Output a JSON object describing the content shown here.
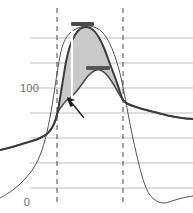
{
  "chart_data": {
    "type": "area",
    "title": "",
    "xlabel": "",
    "ylabel": "",
    "ylim": [
      0,
      200
    ],
    "xlim": [
      0,
      193
    ],
    "grid": true,
    "grid_y_values": [
      0,
      22,
      44,
      66,
      88,
      100,
      122,
      144
    ],
    "axis_ticks": [
      {
        "label": "100",
        "y_value": 100,
        "pixel_y": 88
      },
      {
        "label": "0",
        "y_value": 0,
        "pixel_y": 202
      }
    ],
    "legend": {
      "visible": false,
      "position": "none"
    },
    "colors": {
      "shaded_band": "#c9c9c9",
      "upper_curve": "#3c3c3c",
      "lower_curve": "#4a4a4a",
      "thin_curve": "#555555",
      "gridline": "#b4b4b4",
      "dashed_marker": "#444444",
      "bar_marker_upper": "#4a4a4a",
      "bar_marker_lower": "#555555",
      "cursor_arrow": "#1a1a1a",
      "inner_white_line": "#ffffff",
      "axis_label_text": "#6b6b6b"
    },
    "series": [
      {
        "name": "upper-envelope-curve",
        "style": "solid-dark",
        "points": [
          [
            0,
            150
          ],
          [
            12,
            147
          ],
          [
            22,
            144
          ],
          [
            32,
            141
          ],
          [
            40,
            138
          ],
          [
            48,
            133
          ],
          [
            54,
            124
          ],
          [
            58,
            110
          ],
          [
            62,
            86
          ],
          [
            66,
            62
          ],
          [
            70,
            46
          ],
          [
            75,
            35
          ],
          [
            80,
            29
          ],
          [
            86,
            27
          ],
          [
            92,
            29
          ],
          [
            98,
            36
          ],
          [
            104,
            48
          ],
          [
            110,
            64
          ],
          [
            116,
            80
          ],
          [
            120,
            92
          ],
          [
            123,
            100
          ],
          [
            128,
            104
          ],
          [
            136,
            107
          ],
          [
            146,
            110
          ],
          [
            158,
            113
          ],
          [
            170,
            116
          ],
          [
            182,
            118
          ],
          [
            193,
            119
          ]
        ]
      },
      {
        "name": "lower-envelope-curve",
        "style": "solid-dark",
        "points": [
          [
            0,
            150
          ],
          [
            12,
            147
          ],
          [
            22,
            144
          ],
          [
            32,
            141
          ],
          [
            40,
            138
          ],
          [
            48,
            133
          ],
          [
            54,
            124
          ],
          [
            58,
            112
          ],
          [
            62,
            106
          ],
          [
            66,
            101
          ],
          [
            70,
            98
          ],
          [
            76,
            92
          ],
          [
            82,
            84
          ],
          [
            88,
            76
          ],
          [
            94,
            71
          ],
          [
            100,
            70
          ],
          [
            106,
            74
          ],
          [
            112,
            82
          ],
          [
            118,
            92
          ],
          [
            123,
            100
          ],
          [
            128,
            104
          ],
          [
            136,
            107
          ],
          [
            146,
            110
          ],
          [
            158,
            113
          ],
          [
            170,
            116
          ],
          [
            182,
            118
          ],
          [
            193,
            119
          ]
        ]
      },
      {
        "name": "thin-baseline-curve",
        "style": "solid-thin",
        "points": [
          [
            0,
            198
          ],
          [
            10,
            192
          ],
          [
            20,
            184
          ],
          [
            30,
            173
          ],
          [
            38,
            160
          ],
          [
            45,
            140
          ],
          [
            51,
            112
          ],
          [
            56,
            80
          ],
          [
            60,
            56
          ],
          [
            64,
            42
          ],
          [
            70,
            33
          ],
          [
            78,
            28
          ],
          [
            86,
            26
          ],
          [
            94,
            27
          ],
          [
            102,
            32
          ],
          [
            110,
            44
          ],
          [
            118,
            66
          ],
          [
            124,
            92
          ],
          [
            130,
            124
          ],
          [
            136,
            152
          ],
          [
            142,
            176
          ],
          [
            148,
            192
          ],
          [
            155,
            200
          ],
          [
            163,
            203
          ],
          [
            172,
            201
          ],
          [
            182,
            198
          ],
          [
            193,
            196
          ]
        ]
      }
    ],
    "shaded_band": {
      "name": "confidence-band",
      "description": "gray fill between upper and lower envelope curves",
      "x_start": 54,
      "x_end": 123
    },
    "annotations": [
      {
        "name": "dashed-line-left",
        "type": "vertical-dashed",
        "pixel_x": 57
      },
      {
        "name": "dashed-line-right",
        "type": "vertical-dashed",
        "pixel_x": 123
      },
      {
        "name": "bar-marker-upper",
        "type": "horizontal-bar",
        "pixel_y": 24,
        "x_start": 71,
        "x_end": 94
      },
      {
        "name": "bar-marker-lower",
        "type": "horizontal-bar",
        "pixel_y": 68,
        "x_start": 86,
        "x_end": 110
      },
      {
        "name": "inner-white-line",
        "type": "vertical-line",
        "pixel_x": 72,
        "y_start": 31,
        "y_end": 100
      },
      {
        "name": "cursor-arrow",
        "type": "pointer",
        "tip_x": 67,
        "tip_y": 97,
        "tail_x": 84,
        "tail_y": 118
      }
    ]
  }
}
